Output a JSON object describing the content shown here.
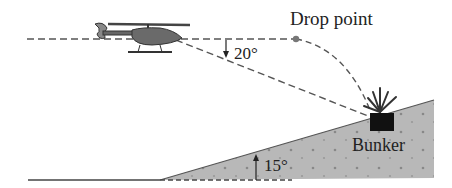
{
  "diagram": {
    "labels": {
      "drop_point": "Drop point",
      "angle_line_of_sight": "20°",
      "angle_incline": "15°",
      "target": "Bunker"
    },
    "values": {
      "line_of_sight_angle_deg": 20,
      "incline_angle_deg": 15
    },
    "elements": [
      "helicopter",
      "horizontal-flight-path",
      "drop-point-dot",
      "trajectory-curve",
      "line-of-sight",
      "inclined-ground",
      "bunker",
      "explosion"
    ],
    "colors": {
      "line": "#555555",
      "ground_fill": "#b5b5b5",
      "bunker": "#111111",
      "text": "#222222"
    }
  }
}
